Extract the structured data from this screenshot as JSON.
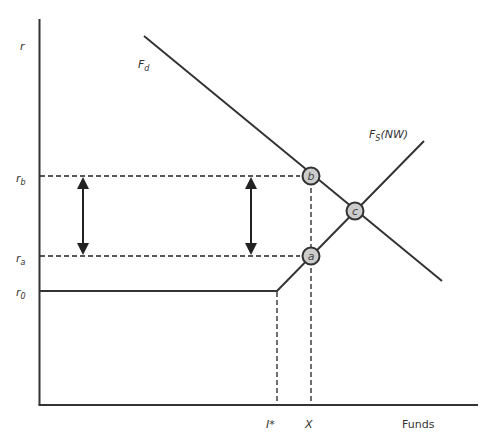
{
  "diagram": {
    "axes": {
      "y_label": "r",
      "x_label": "Funds"
    },
    "y_ticks": [
      {
        "id": "rb",
        "base": "r",
        "sub": "b"
      },
      {
        "id": "ra",
        "base": "r",
        "sub": "a"
      },
      {
        "id": "r0",
        "base": "r",
        "sub": "0"
      }
    ],
    "x_ticks": [
      {
        "id": "istar",
        "label": "I*"
      },
      {
        "id": "x",
        "label": "X"
      }
    ],
    "curves": {
      "demand": {
        "base": "F",
        "sub": "d"
      },
      "supply": {
        "base": "F",
        "sub": "S",
        "suffix": "(NW)"
      }
    },
    "points": {
      "a": "a",
      "b": "b",
      "c": "c"
    },
    "colors": {
      "line": "#333333",
      "point_fill": "#cccccc",
      "point_stroke": "#333333"
    }
  }
}
